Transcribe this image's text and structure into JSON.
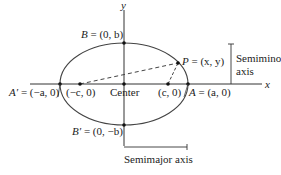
{
  "diagram": {
    "type": "ellipse-anatomy",
    "colors": {
      "stroke": "#333333",
      "text": "#222222",
      "background": "#ffffff"
    },
    "axes": {
      "x_label": "x",
      "y_label": "y"
    },
    "points": {
      "B": {
        "name": "B",
        "coords": "(0, b)"
      },
      "B_prime": {
        "name": "B′",
        "coords": "(0, −b)"
      },
      "A": {
        "name": "A",
        "coords": "(a, 0)"
      },
      "A_prime": {
        "name": "A′",
        "coords": "(−a, 0)"
      },
      "focus_left": {
        "coords": "(−c, 0)"
      },
      "focus_right": {
        "coords": "(c, 0)"
      },
      "P": {
        "name": "P",
        "coords": "(x, y)"
      }
    },
    "labels": {
      "center": "Center",
      "semiminor_line1": "Semiminor",
      "semiminor_line2": "axis",
      "semimajor": "Semimajor axis"
    }
  }
}
